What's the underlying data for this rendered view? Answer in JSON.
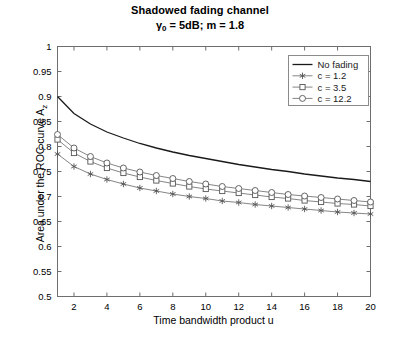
{
  "chart_data": {
    "type": "line",
    "title": "Shadowed fading channel",
    "subtitle_prefix": "γ",
    "subtitle_sub": "0",
    "subtitle_rest": " = 5dB; m = 1.8",
    "xlabel": "Time bandwidth product u",
    "ylabel_prefix": "Area under the ROC curve A",
    "ylabel_sub": "z",
    "xlim": [
      1,
      20
    ],
    "ylim": [
      0.5,
      1
    ],
    "grid": false,
    "legend_position": "upper right",
    "xticks": [
      2,
      4,
      6,
      8,
      10,
      12,
      14,
      16,
      18,
      20
    ],
    "yticks": [
      0.5,
      0.55,
      0.6,
      0.65,
      0.7,
      0.75,
      0.8,
      0.85,
      0.9,
      0.95,
      1
    ],
    "xtick_labels": [
      "2",
      "4",
      "6",
      "8",
      "10",
      "12",
      "14",
      "16",
      "18",
      "20"
    ],
    "ytick_labels": [
      "0.5",
      "0.55",
      "0.6",
      "0.65",
      "0.7",
      "0.75",
      "0.8",
      "0.85",
      "0.9",
      "0.95",
      "1"
    ],
    "x": [
      1,
      2,
      3,
      4,
      5,
      6,
      7,
      8,
      9,
      10,
      11,
      12,
      13,
      14,
      15,
      16,
      17,
      18,
      19,
      20
    ],
    "series": [
      {
        "name": "No fading",
        "marker": "none",
        "values": [
          0.9,
          0.866,
          0.845,
          0.829,
          0.817,
          0.806,
          0.797,
          0.789,
          0.782,
          0.776,
          0.77,
          0.764,
          0.759,
          0.754,
          0.75,
          0.745,
          0.741,
          0.737,
          0.734,
          0.73
        ]
      },
      {
        "name": "c = 12.2",
        "marker": "circle",
        "values": [
          0.824,
          0.797,
          0.78,
          0.767,
          0.757,
          0.749,
          0.742,
          0.736,
          0.73,
          0.725,
          0.72,
          0.716,
          0.712,
          0.708,
          0.704,
          0.701,
          0.698,
          0.695,
          0.692,
          0.689
        ]
      },
      {
        "name": "c = 3.5",
        "marker": "square",
        "values": [
          0.814,
          0.787,
          0.77,
          0.757,
          0.747,
          0.739,
          0.732,
          0.726,
          0.72,
          0.715,
          0.711,
          0.707,
          0.703,
          0.699,
          0.696,
          0.692,
          0.689,
          0.686,
          0.684,
          0.681
        ]
      },
      {
        "name": "c = 1.2",
        "marker": "star",
        "values": [
          0.785,
          0.76,
          0.745,
          0.734,
          0.725,
          0.717,
          0.711,
          0.705,
          0.7,
          0.696,
          0.691,
          0.688,
          0.684,
          0.681,
          0.678,
          0.675,
          0.672,
          0.669,
          0.667,
          0.665
        ]
      }
    ],
    "legend_entries": [
      "No fading",
      "c = 1.2",
      "c = 3.5",
      "c = 12.2"
    ]
  },
  "colors": {
    "background": "#ffffff",
    "axis": "#6e6e6e",
    "curve_plain": "#1a1a1a",
    "curve_marked": "#777777",
    "marker": "#555555",
    "text": "#000000"
  }
}
